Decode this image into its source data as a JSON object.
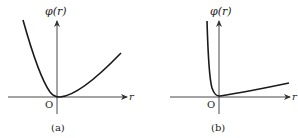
{
  "figure": {
    "panels": [
      {
        "id": "a",
        "caption": "(a)",
        "y_label": "φ(r)",
        "x_label": "r",
        "origin_label": "O",
        "curve_description": "U-shaped: steep descent from upper-left to origin, gentler rise to the right"
      },
      {
        "id": "b",
        "caption": "(b)",
        "y_label": "φ(r)",
        "x_label": "r",
        "origin_label": "O",
        "curve_description": "Nearly vertical descent just left of the y-axis to origin, then slow linear rise to the right"
      }
    ],
    "colors": {
      "stroke": "#1a1a1a",
      "axis": "#333333",
      "background": "#ffffff"
    }
  }
}
